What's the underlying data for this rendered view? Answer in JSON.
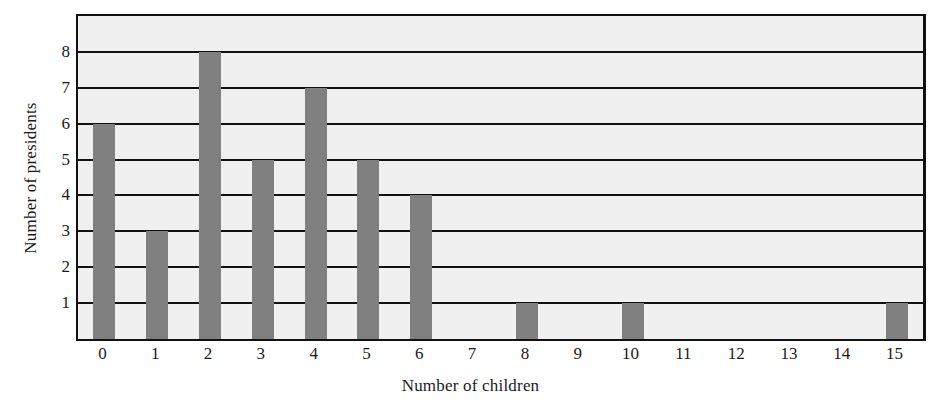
{
  "chart_data": {
    "type": "bar",
    "title": "",
    "xlabel": "Number of children",
    "ylabel": "Number of presidents",
    "categories": [
      "0",
      "1",
      "2",
      "3",
      "4",
      "5",
      "6",
      "7",
      "8",
      "9",
      "10",
      "11",
      "12",
      "13",
      "14",
      "15"
    ],
    "values": [
      6,
      3,
      8,
      5,
      7,
      5,
      4,
      0,
      1,
      0,
      1,
      0,
      0,
      0,
      0,
      1
    ],
    "xtick_labels": [
      "0",
      "1",
      "2",
      "3",
      "4",
      "5",
      "6",
      "7",
      "8",
      "9",
      "10",
      "11",
      "12",
      "13",
      "14",
      "15"
    ],
    "ytick_labels": [
      "1",
      "2",
      "3",
      "4",
      "5",
      "6",
      "7",
      "8"
    ],
    "ytick_values": [
      1,
      2,
      3,
      4,
      5,
      6,
      7,
      8
    ],
    "ylim": [
      0,
      9
    ],
    "xlim": [
      -0.5,
      15.5
    ],
    "grid": "horizontal",
    "legend": "none",
    "bar_color": "#808080",
    "plot_background": "#f0f0f0",
    "axis_color": "#111111",
    "text_color": "#1a1a1a"
  }
}
